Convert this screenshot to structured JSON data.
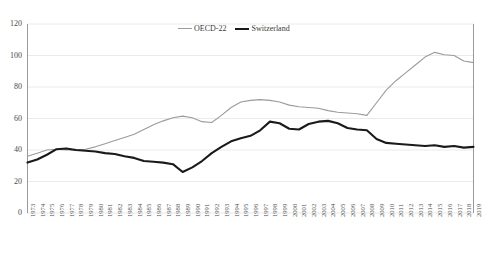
{
  "chart_data": {
    "type": "line",
    "title": "",
    "subtitle": "",
    "xlabel": "",
    "ylabel": "",
    "ylim": [
      0,
      120
    ],
    "yticks": [
      0,
      20,
      40,
      60,
      80,
      100,
      120
    ],
    "grid": "horizontal",
    "legend_position": "top-center",
    "categories": [
      "1973",
      "1974",
      "1975",
      "1976",
      "1977",
      "1978",
      "1979",
      "1980",
      "1981",
      "1982",
      "1983",
      "1984",
      "1985",
      "1986",
      "1987",
      "1988",
      "1989",
      "1990",
      "1991",
      "1992",
      "1993",
      "1994",
      "1995",
      "1996",
      "1997",
      "1998",
      "1999",
      "2000",
      "2001",
      "2002",
      "2003",
      "2004",
      "2005",
      "2006",
      "2007",
      "2008",
      "2009",
      "2010",
      "2011",
      "2012",
      "2013",
      "2014",
      "2015",
      "2016",
      "2017",
      "2018",
      "2019"
    ],
    "series": [
      {
        "name": "OECD-22",
        "color": "#9b9b9b",
        "style": "thin",
        "values": [
          36,
          38,
          40,
          40.5,
          40,
          40,
          40.5,
          42,
          44,
          46,
          48,
          50,
          53,
          56,
          58.5,
          60.5,
          61.5,
          60.5,
          58,
          57.5,
          62,
          67,
          70.5,
          71.5,
          72,
          71.5,
          70.5,
          68.5,
          67.5,
          67,
          66.5,
          65,
          64,
          63.5,
          63,
          62,
          70,
          78,
          84,
          89,
          94,
          99,
          102,
          100.5,
          100,
          96.5,
          95.5
        ]
      },
      {
        "name": "Switzerland",
        "color": "#1a1a1a",
        "style": "thick",
        "values": [
          32,
          34,
          37,
          40.5,
          41,
          40,
          39.5,
          39,
          38,
          37.5,
          36,
          35,
          33,
          32.5,
          32,
          31,
          26,
          29,
          33,
          38,
          42,
          45.5,
          47.5,
          49,
          52.5,
          58,
          57,
          53.5,
          53,
          56.5,
          58,
          58.5,
          57,
          54,
          53,
          52.5,
          47,
          44.5,
          44,
          43.5,
          43,
          42.5,
          43,
          42,
          42.5,
          41.5,
          42
        ]
      }
    ],
    "legend": [
      {
        "label": "OECD-22",
        "swatch": "thin-gray-line"
      },
      {
        "label": "Switzerland",
        "swatch": "thick-black-line"
      }
    ]
  },
  "colors": {
    "oecd_line": "#9b9b9b",
    "switzerland_line": "#1a1a1a",
    "gridline": "#e4e4e4",
    "axis": "#8e8e8e",
    "background": "#ffffff",
    "tick_text": "#4a4a4a"
  }
}
